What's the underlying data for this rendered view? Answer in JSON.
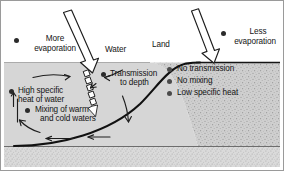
{
  "figure": {
    "width": 284,
    "height": 171,
    "type": "scientific-illustration"
  },
  "colors": {
    "background": "#ffffff",
    "frame": "#9a9a9a",
    "water_fill": "#d6d6d6",
    "land_fill": "#c9c9c9",
    "sediment_fill": "#d2d2d2",
    "ink": "#141414",
    "bullet": "#2b2b2b",
    "arrow": "#1d1d1d"
  },
  "regions": {
    "water_label": "Water",
    "land_label": "Land"
  },
  "water_side": {
    "items": [
      {
        "id": "more-evaporation",
        "text_line1": "More",
        "text_line2": "evaporation"
      },
      {
        "id": "transmission-to-depth",
        "text_line1": "Transmission",
        "text_line2": "to depth"
      },
      {
        "id": "high-specific-heat",
        "text_line1": "High specific",
        "text_line2": "heat of water"
      },
      {
        "id": "mixing",
        "text_line1": "Mixing of warm",
        "text_line2": "and cold waters"
      }
    ]
  },
  "land_side": {
    "items": [
      {
        "id": "less-evaporation",
        "text_line1": "Less",
        "text_line2": "evaporation"
      },
      {
        "id": "no-transmission",
        "text_line1": "No transmission",
        "text_line2": ""
      },
      {
        "id": "no-mixing",
        "text_line1": "No mixing",
        "text_line2": ""
      },
      {
        "id": "low-specific-heat",
        "text_line1": "Low specific heat",
        "text_line2": ""
      }
    ]
  },
  "arrows": {
    "solar_water": "large hollow arrow angled down-right striking water surface",
    "solar_land": "large hollow arrow angled down-right striking land surface",
    "penetration": "segmented hollow arrow continuing below water surface",
    "circulation": "curved arrows showing mixing circulation in water body"
  }
}
